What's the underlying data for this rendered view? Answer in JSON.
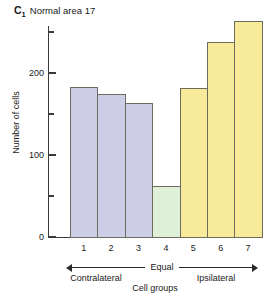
{
  "panel": {
    "letter": "C",
    "letter_subscript": "1",
    "title": "Normal area 17"
  },
  "chart_data": {
    "type": "bar",
    "title": "Normal area 17",
    "xlabel": "Cell groups",
    "ylabel": "Number of cells",
    "categories": [
      "1",
      "2",
      "3",
      "4",
      "5",
      "6",
      "7"
    ],
    "values": [
      183,
      174,
      163,
      62,
      182,
      238,
      263
    ],
    "bar_colors": [
      "#cdcde8",
      "#cdcde8",
      "#cdcde8",
      "#dff0d8",
      "#f7eb9b",
      "#f7eb9b",
      "#f7eb9b"
    ],
    "bar_border_color": "#6b6b5e",
    "ylim": [
      0,
      270
    ],
    "y_major_ticks": [
      0,
      100,
      200
    ],
    "y_minor_ticks": [
      50,
      150,
      250
    ],
    "y_tick_labels": [
      "0",
      "100",
      "200"
    ],
    "grid": false,
    "legend": "none",
    "annotations": {
      "center": "Equal",
      "left": "Contralateral",
      "right": "Ipsilateral"
    }
  },
  "colors": {
    "contralateral_fill": "#cdcde8",
    "equal_fill": "#dff0d8",
    "ipsilateral_fill": "#f7eb9b",
    "bar_border": "#6b6b5e",
    "axis": "#3a3a3a",
    "text": "#1a1a1a",
    "background": "#ffffff"
  }
}
